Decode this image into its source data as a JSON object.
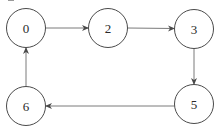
{
  "diagram": {
    "type": "directed-graph",
    "colors": {
      "node_stroke": "#4a4a4a",
      "node_fill": "#ffffff",
      "edge": "#7a7a7a",
      "label": "#2a2a2a"
    },
    "nodes": [
      {
        "id": "0",
        "label": "0",
        "cx": 26,
        "cy": 28,
        "r": 19.5
      },
      {
        "id": "2",
        "label": "2",
        "cx": 108,
        "cy": 28,
        "r": 19.5
      },
      {
        "id": "3",
        "label": "3",
        "cx": 194,
        "cy": 29,
        "r": 19.5
      },
      {
        "id": "5",
        "label": "5",
        "cx": 194,
        "cy": 104,
        "r": 19.5
      },
      {
        "id": "6",
        "label": "6",
        "cx": 26,
        "cy": 106,
        "r": 19.5
      }
    ],
    "edges": [
      {
        "from": "0",
        "to": "2"
      },
      {
        "from": "2",
        "to": "3"
      },
      {
        "from": "3",
        "to": "5"
      },
      {
        "from": "5",
        "to": "6"
      },
      {
        "from": "6",
        "to": "0"
      }
    ]
  }
}
